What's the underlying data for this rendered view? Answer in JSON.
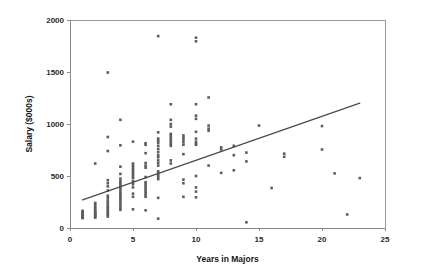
{
  "chart_data": {
    "type": "scatter",
    "title": "",
    "xlabel": "Years in Majors",
    "ylabel": "Salary ($000s)",
    "xlim": [
      0,
      25
    ],
    "ylim": [
      0,
      2000
    ],
    "xticks": [
      0,
      5,
      10,
      15,
      20,
      25
    ],
    "yticks": [
      0,
      500,
      1000,
      1500,
      2000
    ],
    "xtick_labels": [
      "0",
      "5",
      "10",
      "15",
      "20",
      "25"
    ],
    "ytick_labels": [
      "0",
      "500",
      "1000",
      "1500",
      "2000"
    ],
    "grid": false,
    "legend": null,
    "marker_color": "#5d5d5d",
    "marker_size": 2.6,
    "frame_color": "#9a9a9a",
    "series": [
      {
        "name": "Players",
        "points": [
          [
            1,
            100
          ],
          [
            1,
            105
          ],
          [
            1,
            115
          ],
          [
            1,
            125
          ],
          [
            1,
            135
          ],
          [
            1,
            145
          ],
          [
            1,
            155
          ],
          [
            1,
            165
          ],
          [
            1,
            95
          ],
          [
            1,
            110
          ],
          [
            2,
            100
          ],
          [
            2,
            110
          ],
          [
            2,
            120
          ],
          [
            2,
            130
          ],
          [
            2,
            140
          ],
          [
            2,
            150
          ],
          [
            2,
            160
          ],
          [
            2,
            175
          ],
          [
            2,
            190
          ],
          [
            2,
            205
          ],
          [
            2,
            225
          ],
          [
            2,
            240
          ],
          [
            2,
            620
          ],
          [
            3,
            110
          ],
          [
            3,
            125
          ],
          [
            3,
            140
          ],
          [
            3,
            155
          ],
          [
            3,
            175
          ],
          [
            3,
            190
          ],
          [
            3,
            205
          ],
          [
            3,
            225
          ],
          [
            3,
            245
          ],
          [
            3,
            265
          ],
          [
            3,
            290
          ],
          [
            3,
            310
          ],
          [
            3,
            360
          ],
          [
            3,
            400
          ],
          [
            3,
            430
          ],
          [
            3,
            460
          ],
          [
            3,
            740
          ],
          [
            3,
            875
          ],
          [
            3,
            1495
          ],
          [
            4,
            175
          ],
          [
            4,
            195
          ],
          [
            4,
            215
          ],
          [
            4,
            235
          ],
          [
            4,
            255
          ],
          [
            4,
            275
          ],
          [
            4,
            290
          ],
          [
            4,
            310
          ],
          [
            4,
            330
          ],
          [
            4,
            350
          ],
          [
            4,
            370
          ],
          [
            4,
            390
          ],
          [
            4,
            410
          ],
          [
            4,
            430
          ],
          [
            4,
            450
          ],
          [
            4,
            475
          ],
          [
            4,
            520
          ],
          [
            4,
            590
          ],
          [
            4,
            795
          ],
          [
            4,
            1040
          ],
          [
            5,
            180
          ],
          [
            5,
            300
          ],
          [
            5,
            330
          ],
          [
            5,
            390
          ],
          [
            5,
            420
          ],
          [
            5,
            450
          ],
          [
            5,
            480
          ],
          [
            5,
            500
          ],
          [
            5,
            520
          ],
          [
            5,
            540
          ],
          [
            5,
            560
          ],
          [
            5,
            580
          ],
          [
            5,
            600
          ],
          [
            5,
            620
          ],
          [
            5,
            830
          ],
          [
            6,
            170
          ],
          [
            6,
            300
          ],
          [
            6,
            320
          ],
          [
            6,
            340
          ],
          [
            6,
            360
          ],
          [
            6,
            380
          ],
          [
            6,
            400
          ],
          [
            6,
            420
          ],
          [
            6,
            440
          ],
          [
            6,
            490
          ],
          [
            6,
            580
          ],
          [
            6,
            600
          ],
          [
            6,
            625
          ],
          [
            6,
            720
          ],
          [
            6,
            800
          ],
          [
            6,
            815
          ],
          [
            7,
            90
          ],
          [
            7,
            290
          ],
          [
            7,
            470
          ],
          [
            7,
            490
          ],
          [
            7,
            510
          ],
          [
            7,
            530
          ],
          [
            7,
            545
          ],
          [
            7,
            600
          ],
          [
            7,
            625
          ],
          [
            7,
            650
          ],
          [
            7,
            680
          ],
          [
            7,
            700
          ],
          [
            7,
            730
          ],
          [
            7,
            760
          ],
          [
            7,
            790
          ],
          [
            7,
            820
          ],
          [
            7,
            840
          ],
          [
            7,
            860
          ],
          [
            7,
            920
          ],
          [
            7,
            1845
          ],
          [
            8,
            620
          ],
          [
            8,
            650
          ],
          [
            8,
            790
          ],
          [
            8,
            810
          ],
          [
            8,
            830
          ],
          [
            8,
            850
          ],
          [
            8,
            870
          ],
          [
            8,
            890
          ],
          [
            8,
            905
          ],
          [
            8,
            975
          ],
          [
            8,
            1000
          ],
          [
            8,
            1040
          ],
          [
            8,
            1190
          ],
          [
            9,
            300
          ],
          [
            9,
            430
          ],
          [
            9,
            465
          ],
          [
            9,
            710
          ],
          [
            9,
            800
          ],
          [
            9,
            825
          ],
          [
            9,
            850
          ],
          [
            9,
            870
          ],
          [
            9,
            890
          ],
          [
            10,
            295
          ],
          [
            10,
            350
          ],
          [
            10,
            390
          ],
          [
            10,
            500
          ],
          [
            10,
            800
          ],
          [
            10,
            810
          ],
          [
            10,
            830
          ],
          [
            10,
            860
          ],
          [
            10,
            925
          ],
          [
            10,
            1050
          ],
          [
            10,
            1080
          ],
          [
            10,
            1190
          ],
          [
            10,
            1795
          ],
          [
            10,
            1830
          ],
          [
            11,
            600
          ],
          [
            11,
            935
          ],
          [
            11,
            955
          ],
          [
            11,
            985
          ],
          [
            11,
            1255
          ],
          [
            12,
            530
          ],
          [
            12,
            755
          ],
          [
            12,
            775
          ],
          [
            13,
            555
          ],
          [
            13,
            700
          ],
          [
            13,
            790
          ],
          [
            14,
            55
          ],
          [
            14,
            640
          ],
          [
            14,
            725
          ],
          [
            15,
            985
          ],
          [
            16,
            385
          ],
          [
            17,
            685
          ],
          [
            17,
            715
          ],
          [
            20,
            755
          ],
          [
            20,
            980
          ],
          [
            21,
            525
          ],
          [
            22,
            130
          ],
          [
            23,
            480
          ]
        ]
      }
    ],
    "trend_line": {
      "type": "linear-fit",
      "x_start": 1.0,
      "y_start": 270,
      "x_end": 23.0,
      "y_end": 1200
    }
  }
}
